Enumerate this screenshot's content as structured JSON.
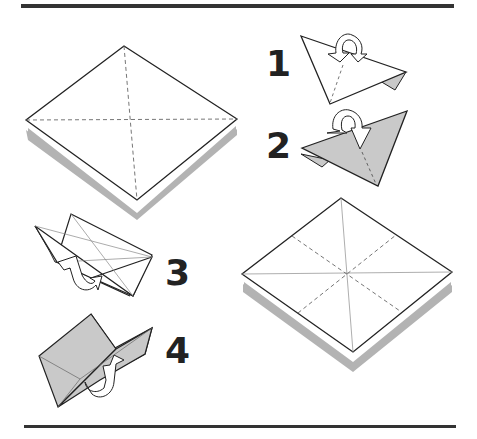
{
  "diagram": {
    "type": "origami-instructions",
    "colors": {
      "rule": "#333333",
      "outline": "#222222",
      "paper": "#ffffff",
      "paper_back": "#c9c9c9",
      "shadow": "#b3b3b3",
      "crease": "#888888",
      "number": "#222222"
    },
    "figures": [
      {
        "id": "base-square",
        "description": "Square shown as diamond with dashed diagonal valley creases and drop shadow"
      },
      {
        "id": "step-1",
        "label": "1",
        "description": "Triangle folded with arrow indicating fold behind"
      },
      {
        "id": "step-2",
        "label": "2",
        "description": "Colored-side triangle with arrow indicating fold"
      },
      {
        "id": "step-3",
        "label": "3",
        "description": "Open box-like fold with arrow"
      },
      {
        "id": "step-4",
        "label": "4",
        "description": "Colored box-like fold with arrow"
      },
      {
        "id": "result-square",
        "description": "Square with solid diagonals and dashed mid-creases, drop shadow"
      }
    ],
    "steps": [
      {
        "label": "1"
      },
      {
        "label": "2"
      },
      {
        "label": "3"
      },
      {
        "label": "4"
      }
    ]
  }
}
